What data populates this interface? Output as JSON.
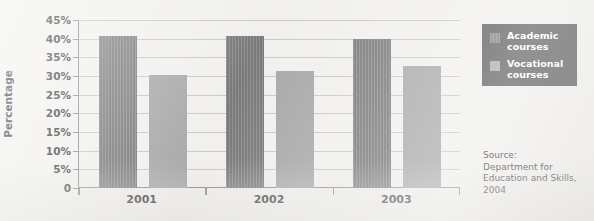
{
  "chart_data": {
    "type": "bar",
    "title": "",
    "xlabel": "",
    "ylabel": "Percentage",
    "categories": [
      "2001",
      "2002",
      "2003"
    ],
    "series": [
      {
        "name": "Academic courses",
        "values": [
          40.6,
          40.8,
          40.0
        ],
        "color": "#808080"
      },
      {
        "name": "Vocational courses",
        "values": [
          30.3,
          31.3,
          32.7
        ],
        "color": "#a8a8a8"
      }
    ],
    "ylim": [
      0,
      45
    ],
    "ytick_values": [
      45,
      40,
      35,
      30,
      25,
      20,
      15,
      10,
      5,
      0
    ],
    "ytick_labels": [
      "45%",
      "40%",
      "35%",
      "30%",
      "25%",
      "20%",
      "15%",
      "10%",
      "5%",
      "0"
    ],
    "grid": true,
    "legend_position": "right-top",
    "annotations": [
      "Source:\nDepartment for\nEducation and Skills,\n2004"
    ]
  },
  "legend": {
    "entries": [
      {
        "label": "Academic\ncourses"
      },
      {
        "label": "Vocational\ncourses"
      }
    ]
  },
  "source": {
    "text": "Source:\nDepartment for\nEducation and Skills,\n2004"
  },
  "colors": {
    "academic": "#808080",
    "vocational": "#a8a8a8",
    "legend_background": "#58585a",
    "legend_text": "#ffffff",
    "axis": "#8d8c8a",
    "gridline": "#c9c8c5",
    "page_background": "#f1f0ee",
    "text": "#3a3a38"
  }
}
